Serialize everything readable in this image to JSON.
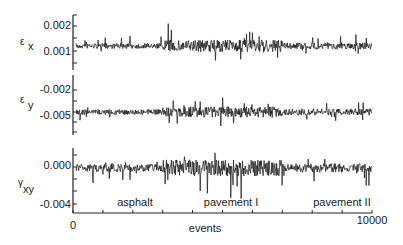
{
  "chart_data": {
    "type": "line",
    "title": "",
    "xlabel": "events",
    "x_ticks": [
      "0",
      "10000"
    ],
    "xlim": [
      0,
      10000
    ],
    "shared_x": true,
    "grid": false,
    "legend": null,
    "annotations": [
      "asphalt",
      "pavement I",
      "pavement II"
    ],
    "segments": [
      {
        "label": "asphalt",
        "x_range": [
          0,
          3000
        ]
      },
      {
        "label": "pavement I",
        "x_range": [
          3000,
          7000
        ]
      },
      {
        "label": "pavement II",
        "x_range": [
          7000,
          10000
        ]
      }
    ],
    "series": [
      {
        "name": "εx",
        "ylabel": "ε x",
        "y_ticks": [
          "0.002",
          "0.001"
        ],
        "ylim": [
          0.0,
          0.0025
        ],
        "baseline": 0.0012,
        "noise_amplitude": {
          "asphalt": 0.0003,
          "pavement I": 0.0007,
          "pavement II": 0.0004
        }
      },
      {
        "name": "εy",
        "ylabel": "ε y",
        "y_ticks": [
          "-0.002",
          "-0.005"
        ],
        "ylim": [
          -0.008,
          -0.001
        ],
        "baseline": -0.0045,
        "noise_amplitude": {
          "asphalt": 0.0008,
          "pavement I": 0.0015,
          "pavement II": 0.001
        }
      },
      {
        "name": "γxy",
        "ylabel": "γxy",
        "y_ticks": [
          "0.000",
          "-0.004"
        ],
        "ylim": [
          -0.005,
          0.001
        ],
        "baseline": -0.0008,
        "noise_amplitude": {
          "asphalt": 0.0008,
          "pavement I": 0.002,
          "pavement II": 0.0012
        }
      }
    ]
  },
  "labels": {
    "panel1_ylabel_main": "ε",
    "panel1_ylabel_sub": "x",
    "panel2_ylabel_main": "ε",
    "panel2_ylabel_sub": "y",
    "panel3_ylabel_main": "γ",
    "panel3_ylabel_sub": "xy",
    "p1_tick_top": "0.002",
    "p1_tick_mid": "0.001",
    "p2_tick_top": "-0.002",
    "p2_tick_mid": "-0.005",
    "p3_tick_top": "0.000",
    "p3_tick_bot": "-0.004",
    "x_tick_start": "0",
    "x_tick_end": "10000",
    "xlabel": "events",
    "seg1": "asphalt",
    "seg2": "pavement I",
    "seg3": "pavement II"
  }
}
